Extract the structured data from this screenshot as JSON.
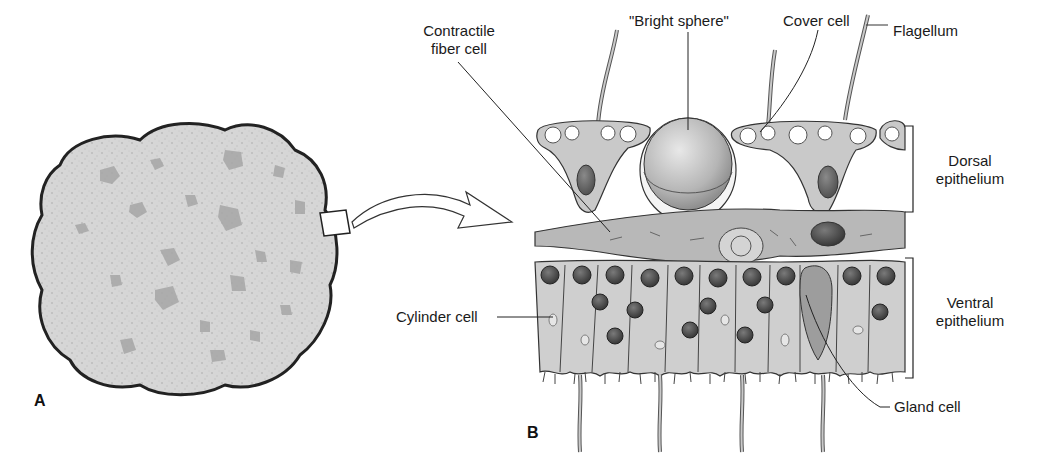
{
  "figure": {
    "panels": [
      {
        "id": "A",
        "letter": "A",
        "description": "Whole organism outline, irregular lobed disc with mottled texture"
      },
      {
        "id": "B",
        "letter": "B",
        "description": "Cross-section of tissue layers"
      }
    ],
    "labels": {
      "contractile_fiber_cell_line1": "Contractile",
      "contractile_fiber_cell_line2": "fiber cell",
      "bright_sphere": "\"Bright sphere\"",
      "cover_cell": "Cover cell",
      "flagellum": "Flagellum",
      "dorsal_epithelium_line1": "Dorsal",
      "dorsal_epithelium_line2": "epithelium",
      "ventral_epithelium_line1": "Ventral",
      "ventral_epithelium_line2": "epithelium",
      "cylinder_cell": "Cylinder cell",
      "gland_cell": "Gland cell"
    },
    "colors": {
      "outline": "#2a2a2a",
      "body_fill": "#d9d9d9",
      "speckle": "#bdbdbd",
      "patch": "#a9a9a9",
      "tissue_fill": "#c9c9c9",
      "nucleus": "#6e6e6e",
      "nucleus_dark": "#4a4a4a",
      "sphere": "#bcbcbc",
      "vacuole": "#ffffff",
      "fiber_layer": "#b5b5b5",
      "text": "#1a1a1a"
    }
  }
}
